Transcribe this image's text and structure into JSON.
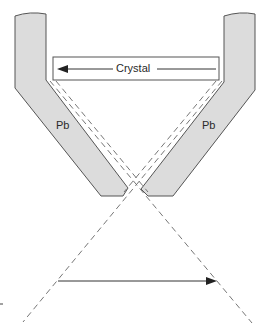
{
  "diagram": {
    "labels": {
      "crystal": "Crystal",
      "left_shield": "Pb",
      "right_shield": "Pb"
    },
    "colors": {
      "shield_fill": "#dcdcdc",
      "stroke": "#555555",
      "dash": "#666666",
      "arrow": "#222222"
    }
  }
}
